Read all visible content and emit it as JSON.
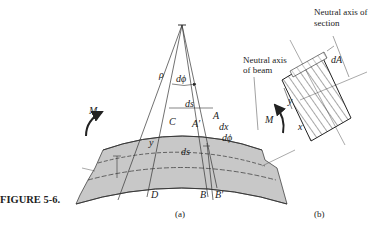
{
  "figure": {
    "caption": "FIGURE 5-6.",
    "panel_a": {
      "label": "(a)",
      "labels": {
        "rho": "ρ",
        "dphi_top": "dϕ",
        "ds_top": "ds",
        "ds_mid": "ds",
        "M_left": "M",
        "M_right": "M",
        "C": "C",
        "A_prime": "A′",
        "A": "A",
        "dx": "dx",
        "dphi_small": "dϕ",
        "y": "y",
        "x": "x",
        "D": "D",
        "B": "B",
        "B_prime": "B′"
      }
    },
    "panel_b": {
      "label": "(b)",
      "labels": {
        "neutral_axis_section_1": "Neutral axis of",
        "neutral_axis_section_2": "section",
        "neutral_axis_beam_1": "Neutral axis",
        "neutral_axis_beam_2": "of beam",
        "dA": "dA",
        "y": "y",
        "M": "M"
      }
    },
    "colors": {
      "beam_fill": "#c8c8c8",
      "line": "#222222"
    }
  }
}
